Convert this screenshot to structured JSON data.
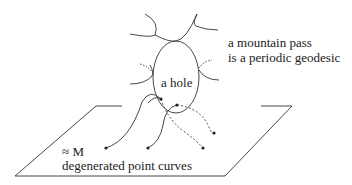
{
  "labels": {
    "mountain_pass_line1": "a mountain pass",
    "mountain_pass_line2": "is a periodic geodesic",
    "hole": "a hole",
    "approx_m": "≈ M",
    "degenerated": "degenerated point curves"
  },
  "colors": {
    "stroke": "#333333",
    "background": "#ffffff"
  }
}
